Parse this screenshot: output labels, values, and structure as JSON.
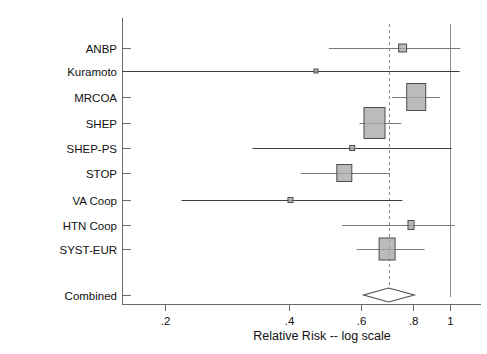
{
  "chart_data": {
    "type": "forest",
    "title": "",
    "xlabel": "Relative Risk -- log scale",
    "ylabel": "",
    "scale": "log",
    "xticks": [
      ".2",
      ".4",
      ".6",
      ".8",
      "1"
    ],
    "xtick_values": [
      0.2,
      0.4,
      0.6,
      0.8,
      1.0
    ],
    "xlim": [
      0.13,
      1.06
    ],
    "grid": false,
    "legend": "none",
    "reference_line": 1.0,
    "pooled_line": 0.705,
    "studies": [
      {
        "label": "ANBP",
        "rr": 0.763,
        "ci_low": 0.503,
        "ci_high": 1.057,
        "weight": "small",
        "marker_w": 8,
        "marker_h": 8
      },
      {
        "label": "Kuramoto",
        "rr": 0.468,
        "ci_low": 0.135,
        "ci_high": 1.053,
        "weight": "very-small",
        "marker_w": 4,
        "marker_h": 4
      },
      {
        "label": "MRCOA",
        "rr": 0.824,
        "ci_low": 0.719,
        "ci_high": 0.941,
        "weight": "large",
        "marker_w": 19,
        "marker_h": 27
      },
      {
        "label": "SHEP",
        "rr": 0.651,
        "ci_low": 0.598,
        "ci_high": 0.757,
        "weight": "largest",
        "marker_w": 21,
        "marker_h": 31
      },
      {
        "label": "SHEP-PS",
        "rr": 0.574,
        "ci_low": 0.327,
        "ci_high": 1.006,
        "weight": "very-small",
        "marker_w": 5,
        "marker_h": 5
      },
      {
        "label": "STOP",
        "rr": 0.549,
        "ci_low": 0.429,
        "ci_high": 0.711,
        "weight": "medium",
        "marker_w": 15,
        "marker_h": 17
      },
      {
        "label": "VA Coop",
        "rr": 0.405,
        "ci_low": 0.219,
        "ci_high": 0.762,
        "weight": "very-small",
        "marker_w": 5,
        "marker_h": 5
      },
      {
        "label": "HTN Coop",
        "rr": 0.8,
        "ci_low": 0.542,
        "ci_high": 1.024,
        "weight": "small",
        "marker_w": 6,
        "marker_h": 9
      },
      {
        "label": "SYST-EUR",
        "rr": 0.699,
        "ci_low": 0.589,
        "ci_high": 0.864,
        "weight": "medium",
        "marker_w": 16,
        "marker_h": 22
      }
    ],
    "summary": {
      "label": "Combined",
      "rr": 0.705,
      "ci_low": 0.655,
      "ci_high": 0.762,
      "shape": "diamond"
    }
  }
}
